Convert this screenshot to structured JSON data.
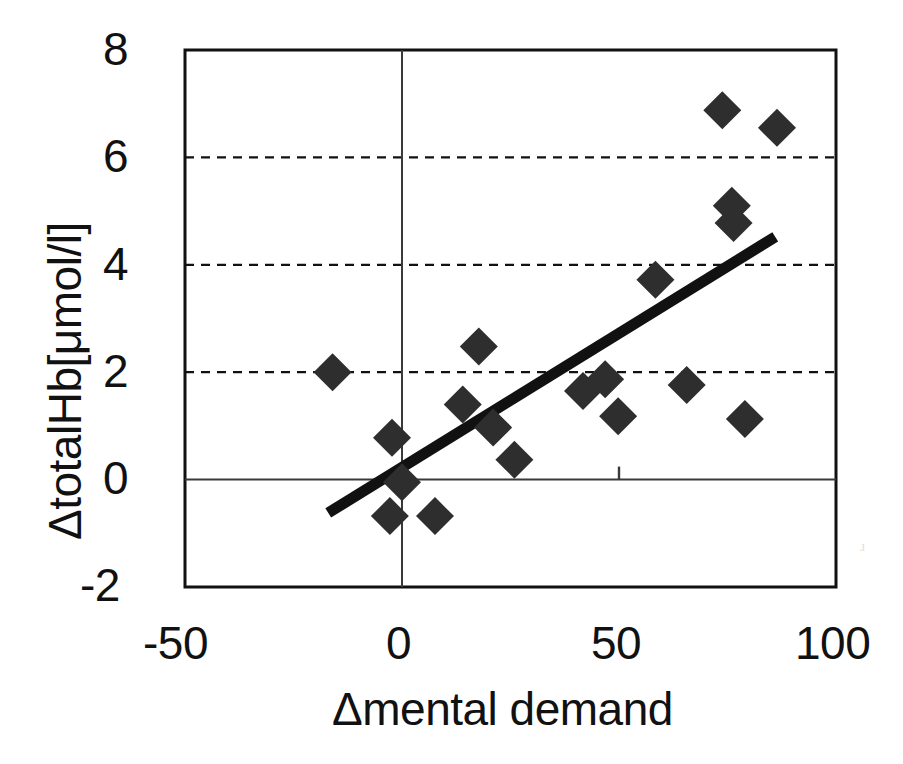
{
  "chart_data": {
    "type": "scatter",
    "title": "",
    "xlabel": "Δmental demand",
    "ylabel": "ΔtotalHb[μmol/l]",
    "xlim": [
      -50,
      100
    ],
    "ylim": [
      -2,
      8
    ],
    "xticks": [
      -50,
      0,
      50,
      100
    ],
    "xtick_labels": [
      "-50",
      "0",
      "50",
      "100"
    ],
    "yticks": [
      -2,
      0,
      2,
      4,
      6,
      8
    ],
    "ytick_labels": [
      "-2",
      "0",
      "2",
      "4",
      "6",
      "8"
    ],
    "grid": "horizontal-dashed at y = 2, 4, 6",
    "legend": "none",
    "marker": "filled-diamond",
    "marker_color": "#2e2e2e",
    "points": [
      {
        "x": -16.0,
        "y": 2.0
      },
      {
        "x": -2.3,
        "y": 0.78
      },
      {
        "x": -2.8,
        "y": -0.68
      },
      {
        "x": 0.0,
        "y": -0.05
      },
      {
        "x": 7.6,
        "y": -0.68
      },
      {
        "x": 14.0,
        "y": 1.4
      },
      {
        "x": 17.7,
        "y": 2.48
      },
      {
        "x": 21.0,
        "y": 0.97
      },
      {
        "x": 25.9,
        "y": 0.37
      },
      {
        "x": 41.7,
        "y": 1.65
      },
      {
        "x": 46.8,
        "y": 1.87
      },
      {
        "x": 49.8,
        "y": 1.18
      },
      {
        "x": 58.4,
        "y": 3.72
      },
      {
        "x": 65.6,
        "y": 1.76
      },
      {
        "x": 76.0,
        "y": 5.1
      },
      {
        "x": 76.4,
        "y": 4.78
      },
      {
        "x": 73.8,
        "y": 6.88
      },
      {
        "x": 79.0,
        "y": 1.13
      },
      {
        "x": 86.4,
        "y": 6.55
      }
    ],
    "trendline": {
      "type": "linear-fit",
      "x_start": -17.0,
      "y_start": -0.62,
      "x_end": 86.0,
      "y_end": 4.52,
      "color": "#111111"
    }
  },
  "axes": {
    "y_title": "ΔtotalHb[μmol/l]",
    "x_title": "Δmental demand",
    "x_tick_labels": [
      "-50",
      "0",
      "50",
      "100"
    ],
    "y_tick_labels": [
      "8",
      "6",
      "4",
      "2",
      "0",
      "-2"
    ]
  }
}
